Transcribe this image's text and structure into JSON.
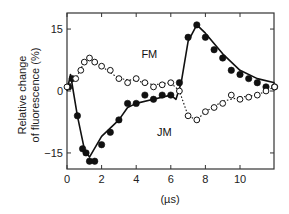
{
  "chart_data": {
    "type": "line",
    "title": "",
    "xlabel": "(µs)",
    "ylabel": "Relative change of fluorescence (%)",
    "ylabel_lines": [
      "Relative change",
      "of fluorescence (%)"
    ],
    "xlim": [
      0,
      12
    ],
    "ylim": [
      -19,
      19
    ],
    "x_ticks": [
      0,
      2,
      4,
      6,
      8,
      10
    ],
    "x_tick_labels": [
      "0",
      "2",
      "4",
      "6",
      "8",
      "10"
    ],
    "y_ticks": [
      -15,
      0,
      15
    ],
    "y_tick_labels": [
      "−15",
      "0",
      "15"
    ],
    "grid": false,
    "legend": "inline labels",
    "series": [
      {
        "name": "JM",
        "marker": "filled-circle",
        "label_position": {
          "x": 5.2,
          "y": -11
        },
        "x": [
          0.1,
          0.3,
          0.6,
          0.9,
          1.1,
          1.3,
          1.6,
          2.0,
          2.5,
          3.0,
          3.5,
          4.0,
          4.5,
          5.0,
          5.5,
          6.0,
          6.5,
          7.0,
          7.5,
          8.0,
          8.5,
          9.0,
          9.5,
          10.0,
          10.5,
          11.0,
          11.5,
          12.0
        ],
        "values": [
          1,
          3,
          -6,
          -14,
          -15,
          -17,
          -17,
          -13,
          -10,
          -7,
          -3,
          -3,
          -1,
          -2,
          -1,
          -1,
          2,
          13,
          16,
          13,
          10,
          8,
          5,
          4,
          3,
          2,
          1,
          1
        ],
        "fit": {
          "style": "solid",
          "x": [
            0.0,
            0.2,
            0.6,
            1.0,
            1.3,
            2.0,
            3.0,
            3.5,
            4.0,
            5.0,
            6.0,
            6.3,
            6.6,
            7.0,
            7.5,
            8.0,
            9.0,
            10.0,
            11.0,
            12.0
          ],
          "values": [
            0,
            4,
            -6,
            -14,
            -16,
            -11,
            -7,
            -4,
            -3,
            -2,
            -1,
            -2,
            2,
            12,
            16,
            14,
            9,
            5,
            3,
            2
          ]
        }
      },
      {
        "name": "FM",
        "marker": "open-circle",
        "label_position": {
          "x": 4.3,
          "y": 8
        },
        "x": [
          0.0,
          0.5,
          0.8,
          1.0,
          1.3,
          1.6,
          2.0,
          2.5,
          3.0,
          3.5,
          4.0,
          4.5,
          5.0,
          5.5,
          6.0,
          6.5,
          7.0,
          7.5,
          8.0,
          8.5,
          9.0,
          9.5,
          10.0,
          10.5,
          11.0,
          11.5,
          12.0
        ],
        "values": [
          1,
          3,
          5,
          7,
          8,
          7,
          6,
          5,
          3,
          2,
          3,
          2,
          1,
          1.5,
          2,
          0,
          -6,
          -7,
          -5,
          -4,
          -3,
          -1,
          -2,
          -1.5,
          -1,
          0,
          1
        ],
        "fit": {
          "style": "dotted",
          "x": [
            0.0,
            0.5,
            1.0,
            1.3,
            2.0,
            3.0,
            4.0,
            5.0,
            6.0,
            6.5,
            7.0,
            7.5,
            8.0,
            9.0,
            10.0,
            11.0,
            12.0
          ],
          "values": [
            1,
            3,
            7,
            8,
            6,
            3,
            2.5,
            1.5,
            2,
            0,
            -6,
            -7,
            -5,
            -2.5,
            -1.5,
            -1,
            1
          ]
        }
      }
    ]
  }
}
